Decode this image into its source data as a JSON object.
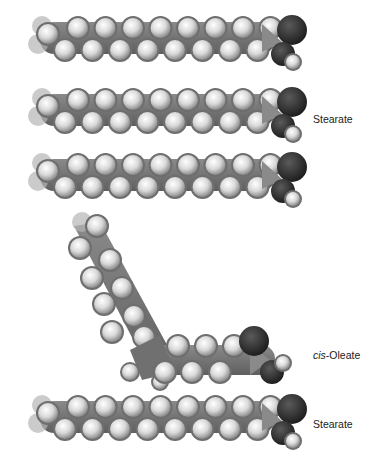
{
  "figure": {
    "molecules": [
      {
        "id": "stearate-1",
        "name": "Stearate",
        "labeled": false,
        "y": 40
      },
      {
        "id": "stearate-2",
        "name": "Stearate",
        "labeled": true,
        "y": 110,
        "label_y": 120
      },
      {
        "id": "stearate-3",
        "name": "Stearate",
        "labeled": false,
        "y": 178
      },
      {
        "id": "cis-oleate",
        "name": "cis-Oleate",
        "labeled": true,
        "label_y": 356
      },
      {
        "id": "stearate-4",
        "name": "Stearate",
        "labeled": true,
        "y": 418,
        "label_y": 425
      }
    ],
    "labels": {
      "stearate_2": "Stearate",
      "cis_oleate_prefix": "cis",
      "cis_oleate_suffix": "-Oleate",
      "stearate_4": "Stearate"
    },
    "colors": {
      "carbon": "#7a7a7a",
      "hydrogen": "#e6e6e6",
      "oxygen": "#2e2e2e",
      "background": "#ffffff"
    }
  }
}
